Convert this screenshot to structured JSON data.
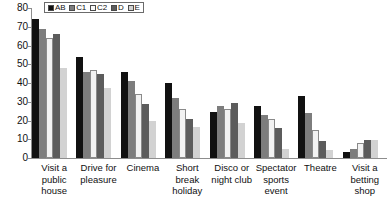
{
  "chart_data": {
    "type": "bar",
    "title": "",
    "xlabel": "",
    "ylabel": "",
    "ylim": [
      0,
      80
    ],
    "yticks": [
      80,
      70,
      60,
      50,
      40,
      30,
      20,
      10,
      0
    ],
    "grid": false,
    "legend_position": "top-left",
    "categories": [
      "Visit a public house",
      "Drive for pleasure",
      "Cinema",
      "Short break holiday",
      "Disco or night club",
      "Spectator sports event",
      "Theatre",
      "Visit a betting shop"
    ],
    "series": [
      {
        "name": "AB",
        "color": "#111111",
        "values": [
          74,
          54,
          46,
          40,
          24.5,
          28,
          33,
          3
        ]
      },
      {
        "name": "C1",
        "color": "#7d7d7d",
        "values": [
          69,
          46,
          41,
          32,
          27.5,
          23,
          24,
          5
        ]
      },
      {
        "name": "C2",
        "color": "#f2f2f2",
        "values": [
          64,
          47,
          34,
          26,
          26,
          21,
          15,
          8
        ]
      },
      {
        "name": "D",
        "color": "#5c5c5c",
        "values": [
          66,
          45,
          29,
          21,
          29.5,
          16,
          9,
          9.5
        ]
      },
      {
        "name": "E",
        "color": "#d2d2d2",
        "values": [
          48,
          37.5,
          20,
          16.5,
          18.5,
          5,
          4.5,
          9.5
        ]
      }
    ]
  },
  "legend": {
    "entries": [
      {
        "label": "AB",
        "swatch": "#111111"
      },
      {
        "label": "C1",
        "swatch": "#7d7d7d"
      },
      {
        "label": "C2",
        "swatch": "#f8f8f8"
      },
      {
        "label": "D",
        "swatch": "#5c5c5c"
      },
      {
        "label": "E",
        "swatch": "#d2d2d2"
      }
    ]
  }
}
